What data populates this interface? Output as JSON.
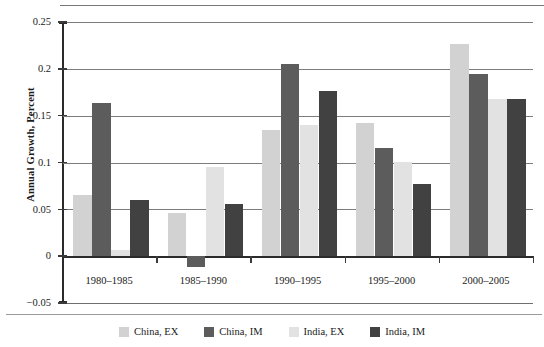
{
  "chart_data": {
    "type": "bar",
    "title": "",
    "xlabel": "",
    "ylabel": "Annual Growth, Percent",
    "ylim": [
      -0.05,
      0.25
    ],
    "ytick_labels": [
      "0.25",
      "0.2",
      "0.15",
      "0.1",
      "0.05",
      "0",
      "−0.05"
    ],
    "ytick_values": [
      0.25,
      0.2,
      0.15,
      0.1,
      0.05,
      0,
      -0.05
    ],
    "grid": true,
    "legend_position": "bottom",
    "categories": [
      "1980–1985",
      "1985–1990",
      "1990–1995",
      "1995–2000",
      "2000–2005"
    ],
    "series": [
      {
        "name": "China, EX",
        "color": "#d2d2d2",
        "values": [
          0.065,
          0.046,
          0.135,
          0.142,
          0.227
        ]
      },
      {
        "name": "China, IM",
        "color": "#5c5c5c",
        "values": [
          0.163,
          -0.012,
          0.205,
          0.116,
          0.194
        ]
      },
      {
        "name": "India, EX",
        "color": "#e2e2e2",
        "values": [
          0.007,
          0.095,
          0.14,
          0.101,
          0.168
        ]
      },
      {
        "name": "India, IM",
        "color": "#414141",
        "values": [
          0.06,
          0.056,
          0.176,
          0.077,
          0.168
        ]
      }
    ]
  },
  "colors": {
    "axis": "#2b2b2b",
    "grid": "#7c7c7c",
    "text": "#1a1a1a",
    "background": "#ffffff"
  }
}
